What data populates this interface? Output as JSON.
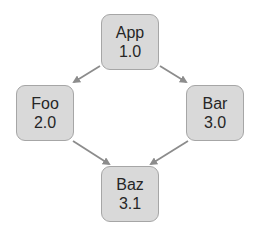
{
  "diagram": {
    "type": "dependency-graph",
    "nodes": [
      {
        "id": "app",
        "name": "App",
        "version": "1.0"
      },
      {
        "id": "foo",
        "name": "Foo",
        "version": "2.0"
      },
      {
        "id": "bar",
        "name": "Bar",
        "version": "3.0"
      },
      {
        "id": "baz",
        "name": "Baz",
        "version": "3.1"
      }
    ],
    "edges": [
      {
        "from": "App",
        "to": "Foo"
      },
      {
        "from": "App",
        "to": "Bar"
      },
      {
        "from": "Foo",
        "to": "Baz"
      },
      {
        "from": "Bar",
        "to": "Baz"
      }
    ],
    "colors": {
      "node_fill": "#d9d9d9",
      "node_border": "#a6a6a6",
      "edge": "#8c8c8c",
      "text": "#262626"
    }
  }
}
